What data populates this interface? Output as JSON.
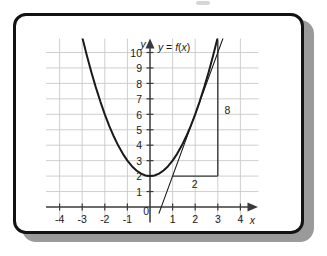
{
  "figure": {
    "kind": "math-graph-card",
    "background": "#ffffff",
    "border_color": "#121212",
    "shadow_color": "#9a9a9a"
  },
  "chart_data": {
    "type": "line",
    "title": "",
    "subtitle": "",
    "xlabel": "x",
    "ylabel": "y",
    "xlim": [
      -4.6,
      4.8
    ],
    "ylim": [
      -1.0,
      10.9
    ],
    "grid": true,
    "grid_color": "#c9c9c9",
    "legend": "none",
    "axis_color": "#3a3a3a",
    "curve_color": "#1a1a1a",
    "x_ticks": [
      -4,
      -3,
      -2,
      -1,
      0,
      1,
      2,
      3,
      4
    ],
    "x_tick_labels": [
      "-4",
      "-3",
      "-2",
      "-1",
      "0",
      "1",
      "2",
      "3",
      "4"
    ],
    "y_ticks": [
      1,
      2,
      3,
      4,
      5,
      6,
      7,
      8,
      9,
      10
    ],
    "y_tick_labels": [
      "1",
      "2",
      "3",
      "4",
      "5",
      "6",
      "7",
      "8",
      "9",
      "10"
    ],
    "series": [
      {
        "name": "y = f(x)",
        "kind": "parabola",
        "equation": "y = x^2 + 2",
        "vertex": [
          0,
          2
        ],
        "color": "#1a1a1a",
        "width": 2.0,
        "x": [
          -3.0,
          -2.8,
          -2.6,
          -2.4,
          -2.2,
          -2.0,
          -1.8,
          -1.6,
          -1.4,
          -1.2,
          -1.0,
          -0.8,
          -0.6,
          -0.4,
          -0.2,
          0.0,
          0.2,
          0.4,
          0.6,
          0.8,
          1.0,
          1.2,
          1.4,
          1.6,
          1.8,
          2.0,
          2.2,
          2.4,
          2.6,
          2.8,
          3.0
        ],
        "y": [
          11.0,
          9.84,
          8.76,
          7.76,
          6.84,
          6.0,
          5.24,
          4.56,
          3.96,
          3.44,
          3.0,
          2.64,
          2.36,
          2.16,
          2.04,
          2.0,
          2.04,
          2.16,
          2.36,
          2.64,
          3.0,
          3.44,
          3.96,
          4.56,
          5.24,
          6.0,
          6.84,
          7.76,
          8.76,
          9.84,
          11.0
        ]
      },
      {
        "name": "tangent-line",
        "kind": "line",
        "equation": "y = 4x - 2",
        "color": "#1a1a1a",
        "width": 1.1,
        "x": [
          0.4,
          3.3
        ],
        "y": [
          -0.4,
          11.2
        ]
      }
    ],
    "annotations": [
      {
        "id": "function-label",
        "text": "y = f(x)",
        "x": 0.35,
        "y": 10.1,
        "italic_vars": true
      },
      {
        "id": "rise-label",
        "text": "8",
        "x": 3.3,
        "y": 6.0
      },
      {
        "id": "run-label",
        "text": "2",
        "x": 1.85,
        "y": 1.25
      },
      {
        "id": "origin-label",
        "text": "0",
        "x": -0.3,
        "y": -0.55
      }
    ],
    "guides": [
      {
        "id": "run-segment",
        "orientation": "horizontal",
        "y": 2,
        "x_from": 1,
        "x_to": 3,
        "color": "#3a3a3a"
      },
      {
        "id": "rise-segment",
        "orientation": "vertical",
        "x": 3,
        "y_from": 2,
        "y_to": 10.8,
        "color": "#3a3a3a"
      }
    ],
    "axis_arrows": {
      "x_axis": "right",
      "y_axis": "up"
    }
  }
}
